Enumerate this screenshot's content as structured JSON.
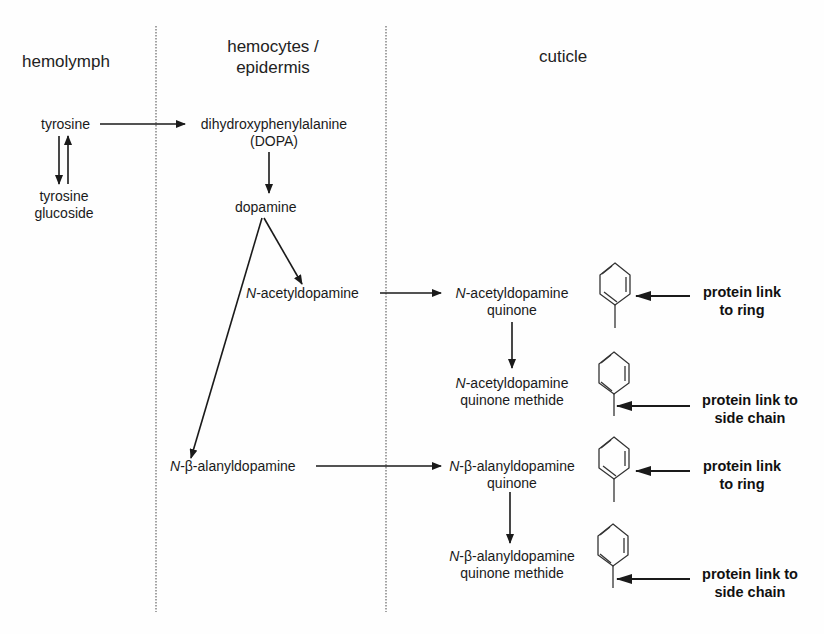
{
  "columns": [
    {
      "id": "hemolymph",
      "header": "hemolymph"
    },
    {
      "id": "hemocytes",
      "header_line1": "hemocytes /",
      "header_line2": "epidermis"
    },
    {
      "id": "cuticle",
      "header": "cuticle"
    }
  ],
  "nodes": {
    "tyrosine": "tyrosine",
    "tyrosine_glucoside_1": "tyrosine",
    "tyrosine_glucoside_2": "glucoside",
    "dopa_1": "dihydroxyphenylalanine",
    "dopa_2": "(DOPA)",
    "dopamine": "dopamine",
    "nada_prefix": "N",
    "nada": "-acetyldopamine",
    "nada_q_prefix": "N",
    "nada_q_1": "-acetyldopamine",
    "nada_q_2": "quinone",
    "nada_qm_prefix": "N",
    "nada_qm_1": "-acetyldopamine",
    "nada_qm_2": "quinone methide",
    "nbad_prefix": "N",
    "nbad": "-β-alanyldopamine",
    "nbad_q_prefix": "N",
    "nbad_q_1": "-β-alanyldopamine",
    "nbad_q_2": "quinone",
    "nbad_qm_prefix": "N",
    "nbad_qm_1": "-β-alanyldopamine",
    "nbad_qm_2": "quinone methide"
  },
  "annotations": [
    {
      "line1": "protein link",
      "line2": "to ring"
    },
    {
      "line1": "protein link to",
      "line2": "side chain"
    },
    {
      "line1": "protein link",
      "line2": "to ring"
    },
    {
      "line1": "protein link to",
      "line2": "side chain"
    }
  ],
  "colors": {
    "ink": "#1a1a1a",
    "divider": "#666666",
    "background": "#fefefe"
  }
}
